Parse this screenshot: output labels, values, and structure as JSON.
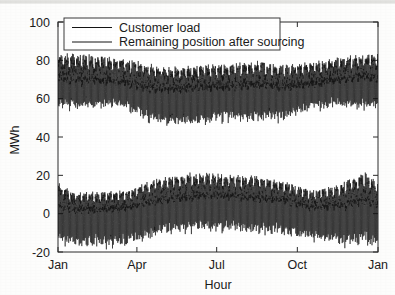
{
  "chart_data": {
    "type": "line",
    "title": "",
    "xlabel": "Hour",
    "ylabel": "MWh",
    "xlim": [
      0,
      8760
    ],
    "ylim": [
      -20,
      100
    ],
    "ytick_values": [
      -20,
      0,
      20,
      40,
      60,
      80,
      100
    ],
    "ytick_labels": [
      "-20",
      "0",
      "20",
      "40",
      "60",
      "80",
      "100"
    ],
    "xtick_values": [
      0,
      2160,
      4344,
      6552,
      8760
    ],
    "xtick_labels": [
      "Jan",
      "Apr",
      "Jul",
      "Oct",
      "Jan"
    ],
    "grid": false,
    "legend_position": "top-left-inside",
    "series": [
      {
        "name": "Customer load",
        "color": "#141414",
        "description": "Hourly customer load with strong daily cycle, oscillating roughly between 45 and 82 MWh; winter peaks near 82, spring/summer dips toward 45-50, autumn recovers toward 80.",
        "envelope_upper_monthly": [
          82,
          81,
          80,
          76,
          75,
          76,
          77,
          78,
          76,
          78,
          80,
          82
        ],
        "envelope_lower_monthly": [
          52,
          52,
          52,
          45,
          44,
          45,
          46,
          46,
          47,
          52,
          53,
          52
        ],
        "mean_monthly": [
          64,
          64,
          63,
          60,
          60,
          61,
          61,
          62,
          61,
          63,
          65,
          66
        ],
        "min": 43,
        "max": 83
      },
      {
        "name": "Remaining position after sourcing",
        "color": "#141414",
        "description": "Residual hourly position after sourcing, centered near 0 MWh, oscillating roughly between -18 and +20 MWh; summer months show higher positive spikes near 20, winter troughs reach -18.",
        "envelope_upper_monthly": [
          10,
          10,
          11,
          16,
          19,
          20,
          19,
          18,
          16,
          11,
          14,
          20
        ],
        "envelope_lower_monthly": [
          -18,
          -18,
          -18,
          -14,
          -12,
          -11,
          -11,
          -12,
          -13,
          -15,
          -18,
          -19
        ],
        "mean_monthly": [
          -2,
          -2,
          -1,
          1,
          3,
          4,
          4,
          3,
          2,
          -1,
          -1,
          0
        ],
        "min": -20,
        "max": 21
      }
    ]
  },
  "legend": {
    "items": [
      {
        "label": "Customer load"
      },
      {
        "label": "Remaining position after sourcing"
      }
    ]
  },
  "axes": {
    "y_title": "MWh",
    "x_title": "Hour"
  }
}
